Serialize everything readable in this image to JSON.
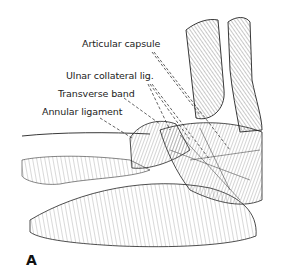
{
  "figure": {
    "panel_letter": "A",
    "labels": [
      {
        "id": "articular-capsule",
        "text": "Articular capsule"
      },
      {
        "id": "ulnar-collateral-lig",
        "text": "Ulnar collateral lig."
      },
      {
        "id": "transverse-band",
        "text": "Transverse band"
      },
      {
        "id": "annular-ligament",
        "text": "Annular ligament"
      }
    ]
  }
}
